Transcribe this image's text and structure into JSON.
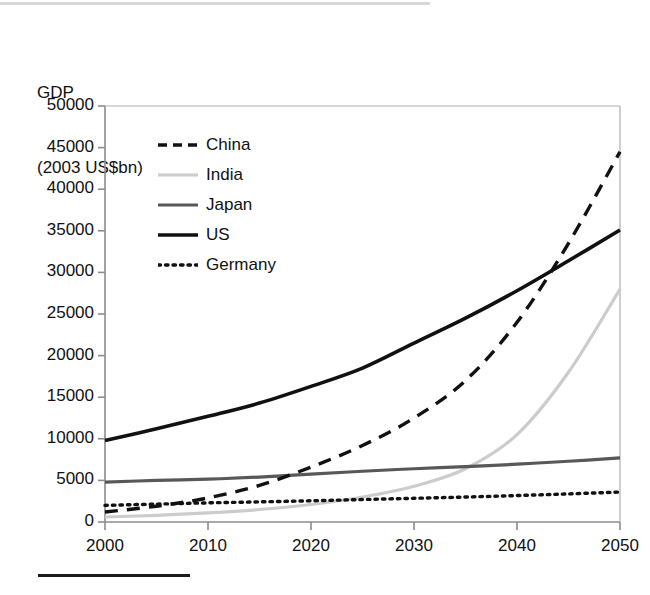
{
  "figure": {
    "axis_title_line1": "GDP",
    "axis_title_line2": "(2003 US$bn)"
  },
  "chart_data": {
    "type": "line",
    "title": "",
    "subtitle": "",
    "xlabel": "",
    "ylabel": "GDP (2003 US$bn)",
    "xlim": [
      2000,
      2050
    ],
    "ylim": [
      0,
      50000
    ],
    "grid": false,
    "legend_position": "upper-left-inside",
    "x_ticks": [
      "2000",
      "2010",
      "2020",
      "2030",
      "2040",
      "2050"
    ],
    "y_ticks": [
      "0",
      "5000",
      "10000",
      "15000",
      "20000",
      "25000",
      "30000",
      "35000",
      "40000",
      "45000",
      "50000"
    ],
    "x": [
      2000,
      2005,
      2010,
      2015,
      2020,
      2025,
      2030,
      2035,
      2040,
      2045,
      2050
    ],
    "series": [
      {
        "name": "China",
        "style": "dashed",
        "color": "#111111",
        "values": [
          1200,
          1900,
          2900,
          4400,
          6600,
          9200,
          12500,
          17000,
          24000,
          33500,
          44500
        ]
      },
      {
        "name": "India",
        "style": "solid",
        "color": "#cccccc",
        "values": [
          600,
          800,
          1100,
          1500,
          2100,
          3000,
          4300,
          6400,
          10500,
          18000,
          28000
        ]
      },
      {
        "name": "Japan",
        "style": "solid",
        "color": "#585858",
        "values": [
          4800,
          5000,
          5150,
          5400,
          5750,
          6100,
          6400,
          6650,
          6950,
          7300,
          7700
        ]
      },
      {
        "name": "US",
        "style": "solid",
        "color": "#111111",
        "values": [
          9800,
          11200,
          12700,
          14300,
          16300,
          18500,
          21500,
          24500,
          27800,
          31400,
          35100
        ]
      },
      {
        "name": "Germany",
        "style": "dotted",
        "color": "#111111",
        "values": [
          2000,
          2150,
          2300,
          2420,
          2550,
          2700,
          2850,
          3000,
          3180,
          3380,
          3600
        ]
      }
    ],
    "annotations": [
      "China overtakes Japan around 2017 near 5500",
      "India overtakes Japan around 2034 near 6700",
      "China overtakes US around 2041 near 28500"
    ]
  }
}
